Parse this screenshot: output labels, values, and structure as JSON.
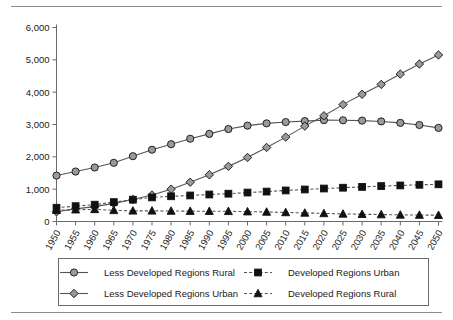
{
  "chart_data": {
    "type": "line",
    "title": "",
    "subtitle": "",
    "xlabel": "",
    "ylabel": "",
    "grid": false,
    "legend_position": "bottom",
    "xlim": [
      1950,
      2050
    ],
    "ylim": [
      0,
      6000
    ],
    "ytick_step": 1000,
    "ytick_labels": [
      "0",
      "1,000",
      "2,000",
      "3,000",
      "4,000",
      "5,000",
      "6,000"
    ],
    "ytick_values": [
      0,
      1000,
      2000,
      3000,
      4000,
      5000,
      6000
    ],
    "categories": [
      "1950",
      "1955",
      "1960",
      "1965",
      "1970",
      "1975",
      "1980",
      "1985",
      "1990",
      "1995",
      "2000",
      "2005",
      "2010",
      "2015",
      "2020",
      "2025",
      "2030",
      "2035",
      "2040",
      "2045",
      "2050"
    ],
    "x": [
      1950,
      1955,
      1960,
      1965,
      1970,
      1975,
      1980,
      1985,
      1990,
      1995,
      2000,
      2005,
      2010,
      2015,
      2020,
      2025,
      2030,
      2035,
      2040,
      2045,
      2050
    ],
    "series": [
      {
        "name": "Less Developed Regions Rural",
        "marker": "circle",
        "marker_fill": "#9a9a9a",
        "line_style": "solid",
        "line_color": "#555555",
        "values": [
          1420,
          1545,
          1670,
          1815,
          2020,
          2220,
          2390,
          2560,
          2710,
          2860,
          2965,
          3035,
          3075,
          3105,
          3135,
          3130,
          3120,
          3095,
          3050,
          2985,
          2895
        ]
      },
      {
        "name": "Less Developed Regions Urban",
        "marker": "diamond",
        "marker_fill": "#9a9a9a",
        "line_style": "solid",
        "line_color": "#555555",
        "values": [
          300,
          390,
          460,
          560,
          680,
          820,
          1000,
          1215,
          1445,
          1705,
          1980,
          2290,
          2610,
          2950,
          3270,
          3615,
          3935,
          4240,
          4560,
          4870,
          5150
        ]
      },
      {
        "name": "Developed Regions Urban",
        "marker": "square",
        "marker_fill": "#111111",
        "line_style": "dashed",
        "line_color": "#555555",
        "values": [
          425,
          475,
          520,
          600,
          675,
          745,
          780,
          805,
          835,
          860,
          895,
          925,
          960,
          990,
          1020,
          1045,
          1070,
          1095,
          1115,
          1135,
          1150
        ]
      },
      {
        "name": "Developed Regions Rural",
        "marker": "triangle",
        "marker_fill": "#111111",
        "line_style": "dashed",
        "line_color": "#555555",
        "values": [
          350,
          365,
          375,
          345,
          330,
          330,
          325,
          320,
          318,
          315,
          305,
          295,
          280,
          265,
          250,
          235,
          225,
          215,
          205,
          200,
          195
        ]
      }
    ]
  },
  "legend": {
    "entries": [
      {
        "label": "Less Developed Regions Rural",
        "marker": "circle"
      },
      {
        "label": "Developed Regions Urban",
        "marker": "square"
      },
      {
        "label": "Less Developed Regions Urban",
        "marker": "diamond"
      },
      {
        "label": "Developed Regions Rural",
        "marker": "triangle"
      }
    ]
  },
  "colors": {
    "axis": "#6a6a6a",
    "text": "#1a1a1a",
    "marker_gray": "#9a9a9a",
    "marker_black": "#111111",
    "line": "#555555",
    "rule": "#8d8d8d",
    "legend_border": "#6a6a6a"
  }
}
